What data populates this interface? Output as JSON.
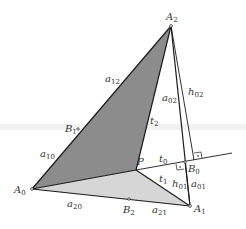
{
  "figure": {
    "colors": {
      "dark_face": "#8c8c8c",
      "light_face": "#d6d6d6",
      "stroke": "#1a1a1a",
      "text": "#333333"
    },
    "points": {
      "A0": {
        "name": "A",
        "sub": "0",
        "x": 32,
        "y": 189
      },
      "A1": {
        "name": "A",
        "sub": "1",
        "x": 190,
        "y": 206
      },
      "A2": {
        "name": "A",
        "sub": "2",
        "x": 171,
        "y": 26
      },
      "P": {
        "name": "P",
        "sub": "",
        "x": 136,
        "y": 170
      },
      "B0": {
        "name": "B",
        "sub": "0",
        "x": 185,
        "y": 162
      },
      "B1": {
        "name": "B",
        "sub": "1",
        "x": 78,
        "y": 129
      },
      "B2": {
        "name": "B",
        "sub": "2",
        "x": 129,
        "y": 199
      }
    },
    "edge_labels": {
      "a12": {
        "name": "a",
        "sub": "12"
      },
      "a10": {
        "name": "a",
        "sub": "10"
      },
      "a20": {
        "name": "a",
        "sub": "20"
      },
      "a21": {
        "name": "a",
        "sub": "21"
      },
      "a02": {
        "name": "a",
        "sub": "02"
      },
      "a01": {
        "name": "a",
        "sub": "01"
      },
      "h02": {
        "name": "h",
        "sub": "02"
      },
      "h01": {
        "name": "h",
        "sub": "01"
      },
      "t0": {
        "name": "t",
        "sub": "0"
      },
      "t1": {
        "name": "t",
        "sub": "1"
      },
      "t2": {
        "name": "t",
        "sub": "2"
      }
    },
    "right_angle_markers": [
      "at B0 between h01 and t0",
      "at foot of h02 on t0"
    ]
  }
}
